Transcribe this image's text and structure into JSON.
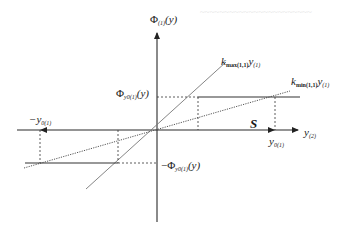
{
  "diagram": {
    "type": "piecewise-linear characteristic with bounding sector lines",
    "axes": {
      "vertical_label_base": "Φ",
      "vertical_label_sub": "(1)",
      "vertical_label_arg": "(y)",
      "horizontal_label_base": "y",
      "horizontal_label_sub": "(2)"
    },
    "lines": {
      "upper_line_label_base": "k",
      "upper_line_label_sub": "max(1,1)",
      "upper_line_label_var": "y",
      "upper_line_label_var_sub": "(1)",
      "lower_line_label_base": "k",
      "lower_line_label_sub": "min(1,1)",
      "lower_line_label_var": "y",
      "lower_line_label_var_sub": "(1)"
    },
    "levels": {
      "pos_phi_base": "Φ",
      "pos_phi_sub": "y0(1)",
      "pos_phi_arg": "(y)",
      "neg_phi_prefix": "−Φ",
      "neg_phi_sub": "y0(1)",
      "neg_phi_arg": "(y)"
    },
    "x_marks": {
      "neg_y0_prefix": "−y",
      "neg_y0_sub": "0(1)",
      "pos_y0_base": "y",
      "pos_y0_sub": "0(1)"
    },
    "region_label": "S",
    "colors": {
      "axis": "#2a2a2a",
      "line": "#555555",
      "dashed": "#333333",
      "ghost_text": "#e6e6e6"
    }
  }
}
